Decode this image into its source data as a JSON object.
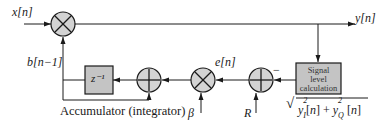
{
  "diagram": {
    "colors": {
      "line": "#1a1a1a",
      "block_fill": "#c4c4c4",
      "node_fill": "#d3d3d3"
    },
    "signals": {
      "input": "x[n]",
      "output": "y[n]",
      "feedback": "b[n−1]",
      "error": "e[n]",
      "step_size": "β",
      "reference": "R"
    },
    "blocks": {
      "delay": "z⁻¹",
      "signal_level": [
        "Signal",
        "level",
        "calculation"
      ]
    },
    "nodes": {
      "multiplier_main": "×",
      "multiplier_beta": "×",
      "adder_accum": "+",
      "adder_ref": "+"
    },
    "signs": {
      "minus": "−"
    },
    "captions": {
      "accumulator": "Accumulator (integrator)",
      "formula": "√(y₁²[n] + y_Q²[n])"
    },
    "formula_parts": {
      "sqrt": "√",
      "yI": "y",
      "sub_I": "I",
      "sq": "2",
      "n1": "[n] + ",
      "yQ": "y",
      "sub_Q": "Q",
      "n2": " [n]"
    }
  }
}
